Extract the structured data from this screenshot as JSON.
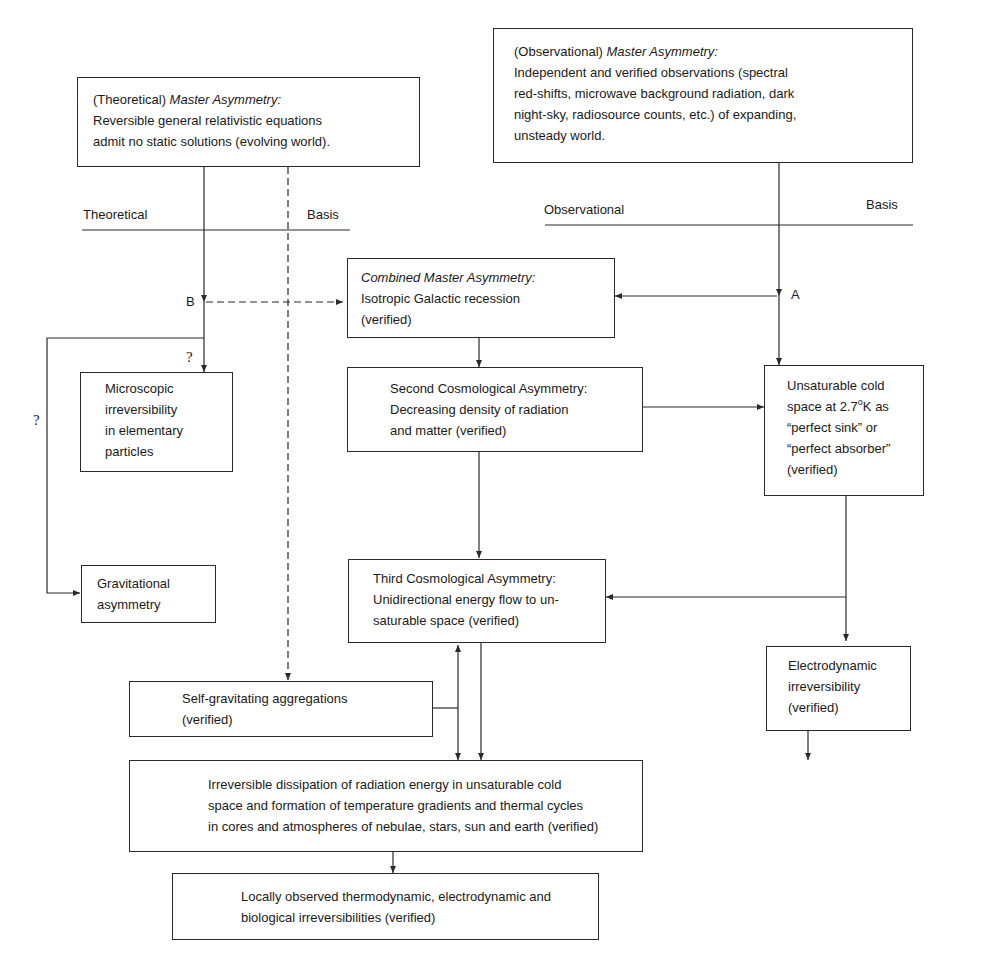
{
  "diagram": {
    "theoretical_master": {
      "prefix": "(Theoretical) ",
      "title": "Master Asymmetry:",
      "lines": [
        "Reversible general relativistic equations",
        "admit no static solutions (evolving world)."
      ]
    },
    "observational_master": {
      "prefix": "(Observational) ",
      "title": "Master Asymmetry:",
      "lines": [
        "Independent and verified observations (spectral",
        "red-shifts, microwave background radiation, dark",
        "night-sky, radiosource counts, etc.) of expanding,",
        "unsteady world."
      ]
    },
    "theoretical_basis": {
      "left": "Theoretical",
      "right": "Basis"
    },
    "observational_basis": {
      "left": "Observational",
      "right": "Basis"
    },
    "combined_master": {
      "title": "Combined Master Asymmetry:",
      "lines": [
        "Isotropic Galactic recession",
        "(verified)"
      ]
    },
    "node_labels": {
      "a": "A",
      "b": "B"
    },
    "uncertain_marks": {
      "microscopic": "?",
      "gravitational": "?"
    },
    "microscopic": {
      "lines": [
        "Microscopic",
        "irreversibility",
        "in elementary",
        "particles"
      ]
    },
    "second_asymmetry": {
      "lines": [
        "Second Cosmological Asymmetry:",
        "Decreasing density of radiation",
        "and matter (verified)"
      ]
    },
    "cold_space": {
      "line1": "Unsaturable cold",
      "line2_pre": "space at 2.7",
      "line2_sup": "o",
      "line2_post": "K as",
      "line3": "“perfect sink” or",
      "line4": "“perfect absorber”",
      "line5": "(verified)"
    },
    "gravitational": {
      "lines": [
        "Gravitational",
        "asymmetry"
      ]
    },
    "third_asymmetry": {
      "lines": [
        "Third Cosmological Asymmetry:",
        "Unidirectional energy flow to un-",
        "saturable space (verified)"
      ]
    },
    "electrodynamic": {
      "lines": [
        "Electrodynamic",
        "irreversibility",
        "(verified)"
      ]
    },
    "self_gravitating": {
      "lines": [
        "Self-gravitating aggregations",
        "(verified)"
      ]
    },
    "dissipation": {
      "lines": [
        "Irreversible dissipation of radiation energy in unsaturable cold",
        "space and formation of temperature gradients and thermal cycles",
        "in cores and atmospheres of nebulae, stars, sun and earth (verified)"
      ]
    },
    "local": {
      "lines": [
        "Locally observed thermodynamic, electrodynamic and",
        "biological irreversibilities (verified)"
      ]
    },
    "colors": {
      "ink": "#2a2a2a",
      "paper": "#ffffff"
    }
  }
}
